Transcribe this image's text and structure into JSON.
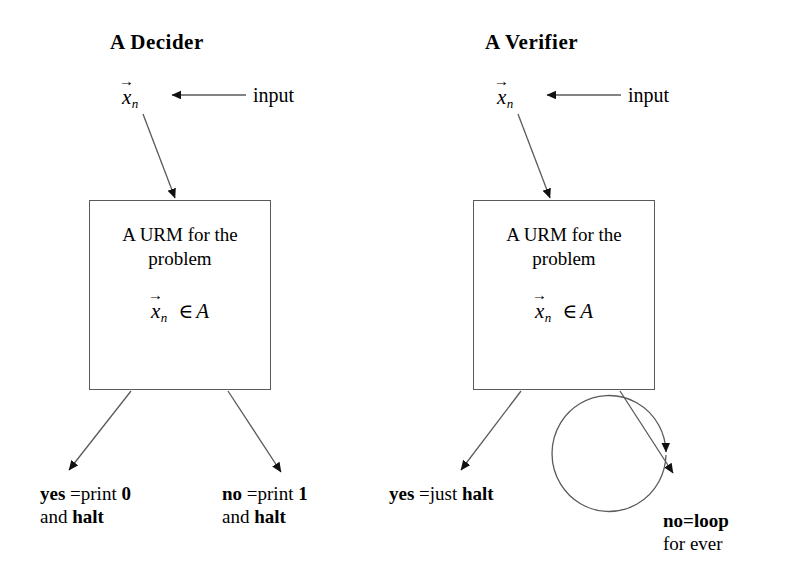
{
  "page": {
    "background_color": "#ffffff",
    "ink_color": "#000000",
    "line_color": "#5a5a5a"
  },
  "panels": {
    "decider": {
      "title": "A  Decider",
      "input_vector": {
        "symbol": "x",
        "subscript": "n",
        "accent": "vector-arrow"
      },
      "input_label": "input",
      "box": {
        "heading_line1": "A URM for the",
        "heading_line2": "problem",
        "formula_symbol": "x",
        "formula_subscript": "n",
        "formula_relation": "∈",
        "formula_set": "A"
      },
      "outcomes": [
        {
          "name": "yes-branch",
          "keyword": "yes",
          "middle": " =print ",
          "value": "0",
          "line2_prefix": "and ",
          "line2_keyword": "halt"
        },
        {
          "name": "no-branch",
          "keyword": "no",
          "middle": " =print ",
          "value": "1",
          "line2_prefix": "and ",
          "line2_keyword": "halt"
        }
      ]
    },
    "verifier": {
      "title": "A Verifier",
      "input_vector": {
        "symbol": "x",
        "subscript": "n",
        "accent": "vector-arrow"
      },
      "input_label": "input",
      "box": {
        "heading_line1": "A URM for the",
        "heading_line2": "problem",
        "formula_symbol": "x",
        "formula_subscript": "n",
        "formula_relation": "∈",
        "formula_set": "A"
      },
      "outcomes": [
        {
          "name": "yes-branch",
          "keyword": "yes",
          "middle": " =just ",
          "value": "halt",
          "value_bold": true
        },
        {
          "name": "no-branch",
          "keyword": "no=loop",
          "line2": "for ever"
        }
      ]
    }
  }
}
